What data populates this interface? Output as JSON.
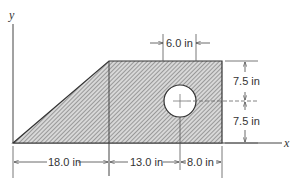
{
  "figure": {
    "axes": {
      "x_label": "x",
      "y_label": "y"
    },
    "shape": {
      "description": "Hatched trapezoidal plate with circular hole",
      "hatch_color": "#8a8a8a",
      "outline_color": "#333333"
    },
    "dimensions": {
      "hole_diameter": "6.0 in",
      "upper_height": "7.5 in",
      "lower_height": "7.5 in",
      "base_left": "18.0 in",
      "base_middle": "13.0 in",
      "base_right": "8.0 in"
    }
  }
}
